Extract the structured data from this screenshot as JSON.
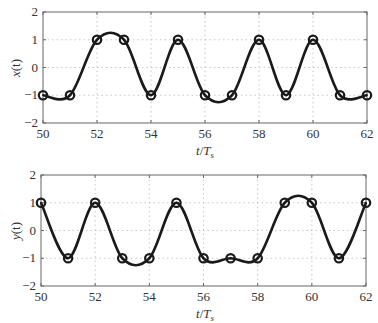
{
  "chart_data": [
    {
      "type": "line",
      "title": "",
      "xlabel": "t/T_s",
      "ylabel": "x(t)",
      "xlim": [
        50,
        62
      ],
      "ylim": [
        -2,
        2
      ],
      "xticks": [
        50,
        52,
        54,
        56,
        58,
        60,
        62
      ],
      "yticks": [
        -2,
        -1,
        0,
        1,
        2
      ],
      "grid": true,
      "markers": "circle",
      "x": [
        50,
        51,
        52,
        53,
        54,
        55,
        56,
        57,
        58,
        59,
        60,
        61,
        62
      ],
      "series": [
        {
          "name": "x(t)",
          "values": [
            -1,
            -1,
            1,
            1,
            -1,
            1,
            -1,
            -1,
            1,
            -1,
            1,
            -1,
            -1
          ]
        }
      ],
      "box": {
        "left": 43,
        "right": 367,
        "top": 12,
        "bottom": 123
      }
    },
    {
      "type": "line",
      "title": "",
      "xlabel": "t/T_s",
      "ylabel": "y(t)",
      "xlim": [
        50,
        62
      ],
      "ylim": [
        -2,
        2
      ],
      "xticks": [
        50,
        52,
        54,
        56,
        58,
        60,
        62
      ],
      "yticks": [
        -2,
        -1,
        0,
        1,
        2
      ],
      "grid": true,
      "markers": "circle",
      "x": [
        50,
        51,
        52,
        53,
        54,
        55,
        56,
        57,
        58,
        59,
        60,
        61,
        62
      ],
      "series": [
        {
          "name": "y(t)",
          "values": [
            1,
            -1,
            1,
            -1,
            -1,
            1,
            -1,
            -1,
            -1,
            1,
            1,
            -1,
            1
          ]
        }
      ],
      "box": {
        "left": 41,
        "right": 366,
        "top": 175,
        "bottom": 286
      }
    }
  ],
  "labels": {
    "top_ylabel_var": "x",
    "top_ylabel_arg": "(t)",
    "bottom_ylabel_var": "y",
    "bottom_ylabel_arg": "(t)",
    "xlabel_t": "t",
    "xlabel_slash": "/",
    "xlabel_T": "T",
    "xlabel_sub": "s"
  }
}
